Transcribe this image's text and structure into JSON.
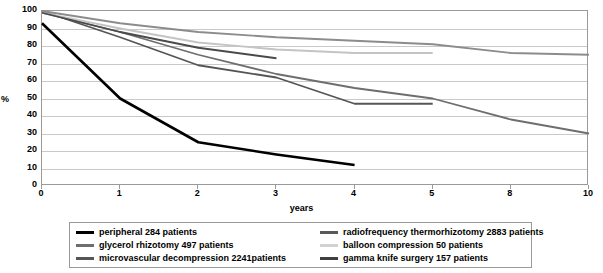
{
  "chart_data": {
    "type": "line",
    "title": "",
    "xlabel": "years",
    "ylabel": "%",
    "categories": [
      "0",
      "1",
      "2",
      "3",
      "4",
      "5",
      "8",
      "10"
    ],
    "x_is_categorical": true,
    "ylim": [
      0,
      100
    ],
    "yticks": [
      0,
      10,
      20,
      30,
      40,
      50,
      60,
      70,
      80,
      90,
      100
    ],
    "grid": "horizontal",
    "legend_position": "bottom",
    "series": [
      {
        "name": "peripheral 284 patients",
        "color": "#000000",
        "width": 2.6,
        "x": [
          "0",
          "1",
          "2",
          "3",
          "4"
        ],
        "values": [
          93,
          50,
          25,
          18,
          12
        ]
      },
      {
        "name": "glycerol rhizotomy 497 patients",
        "color": "#6e6e6e",
        "width": 1.8,
        "x": [
          "0",
          "1",
          "2",
          "3",
          "4",
          "5",
          "8",
          "10"
        ],
        "values": [
          99,
          88,
          75,
          64,
          56,
          50,
          38,
          30
        ]
      },
      {
        "name": "microvascular decompression 2241patients",
        "color": "#555555",
        "width": 1.8,
        "x": [
          "0",
          "1",
          "2",
          "3",
          "4",
          "5"
        ],
        "values": [
          100,
          85,
          69,
          62,
          47,
          47
        ]
      },
      {
        "name": "radiofrequency thermorhizotomy 2883 patients",
        "color": "#8c8c8c",
        "width": 1.8,
        "x": [
          "0",
          "1",
          "2",
          "3",
          "4",
          "5",
          "8",
          "10"
        ],
        "values": [
          100,
          93,
          88,
          85,
          83,
          81,
          76,
          75
        ]
      },
      {
        "name": "balloon compression 50 patients",
        "color": "#c4c4c4",
        "width": 1.8,
        "x": [
          "0",
          "1",
          "2",
          "3",
          "4",
          "5"
        ],
        "values": [
          99,
          90,
          82,
          78,
          76,
          76
        ]
      },
      {
        "name": "gamma knife surgery 157 patients",
        "color": "#4a4a4a",
        "width": 1.8,
        "x": [
          "0",
          "1",
          "2",
          "3"
        ],
        "values": [
          99,
          88,
          79,
          73
        ]
      }
    ]
  },
  "axes": {
    "ylabel": "%",
    "xlabel": "years",
    "yticks": [
      "100",
      "90",
      "80",
      "70",
      "60",
      "50",
      "40",
      "30",
      "20",
      "10",
      "0"
    ],
    "xticks": [
      "0",
      "1",
      "2",
      "3",
      "4",
      "5",
      "8",
      "10"
    ]
  },
  "legend": {
    "left_column": [
      {
        "label": "peripheral 284 patients",
        "color": "#000000",
        "thickness": "3px"
      },
      {
        "label": "glycerol rhizotomy 497 patients",
        "color": "#6e6e6e",
        "thickness": "3px"
      },
      {
        "label": "microvascular decompression 2241patients",
        "color": "#555555",
        "thickness": "3px"
      }
    ],
    "right_column": [
      {
        "label": "radiofrequency thermorhizotomy 2883 patients",
        "color": "#5a5a5a",
        "thickness": "3px"
      },
      {
        "label": "balloon compression 50 patients",
        "color": "#d2d2d2",
        "thickness": "3px"
      },
      {
        "label": "gamma knife surgery 157 patients",
        "color": "#3f3f3f",
        "thickness": "3px"
      }
    ]
  }
}
